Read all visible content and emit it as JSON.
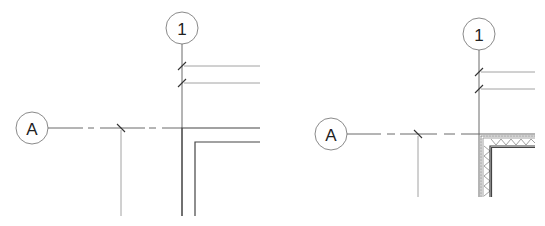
{
  "diagram": {
    "panels": [
      {
        "name": "simple-wall-corner",
        "grid_horizontal": {
          "label": "A"
        },
        "grid_vertical": {
          "label": "1"
        },
        "wall_type": "two-line"
      },
      {
        "name": "layered-wall-corner",
        "grid_horizontal": {
          "label": "A"
        },
        "grid_vertical": {
          "label": "1"
        },
        "wall_type": "layered-with-insulation"
      }
    ],
    "colors": {
      "line": "#6a6a6a",
      "dark_line": "#444444",
      "background": "#ffffff"
    }
  }
}
